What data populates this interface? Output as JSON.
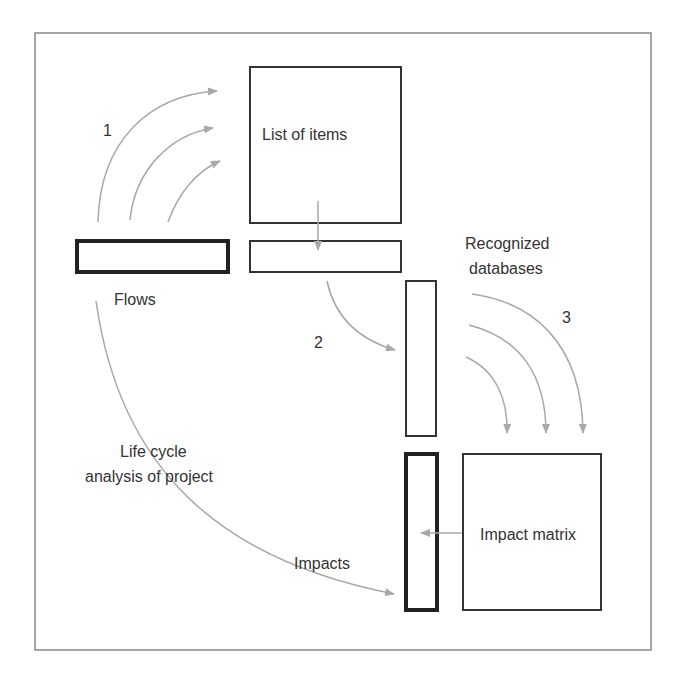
{
  "labels": {
    "list_of_items": "List of items",
    "flows": "Flows",
    "recognized_line1": "Recognized",
    "recognized_line2": "databases",
    "lca_line1": "Life cycle",
    "lca_line2": "analysis of project",
    "impacts": "Impacts",
    "impact_matrix": "Impact matrix",
    "step1": "1",
    "step2": "2",
    "step3": "3"
  },
  "colors": {
    "frame": "#888888",
    "box": "#333333",
    "arrow": "#a8a8a8",
    "text": "#333333"
  }
}
